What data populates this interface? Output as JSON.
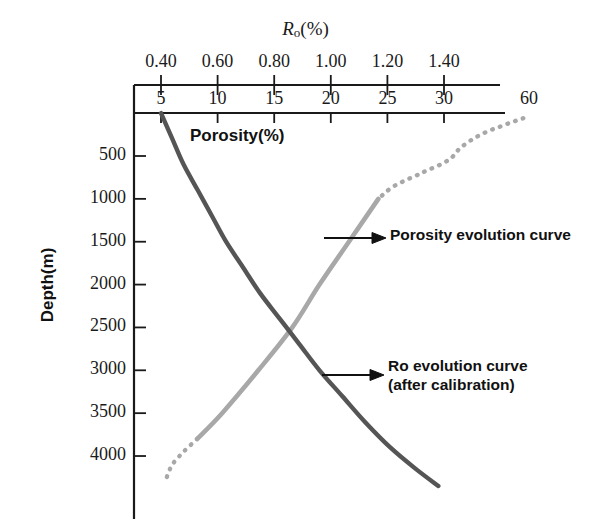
{
  "axes": {
    "ro": {
      "title_main": "R",
      "title_sub": "o",
      "title_unit": "(%)",
      "ticks": [
        "0.40",
        "0.60",
        "0.80",
        "1.00",
        "1.20",
        "1.40"
      ],
      "tick_values": [
        0.4,
        0.6,
        0.8,
        1.0,
        1.2,
        1.4
      ]
    },
    "porosity": {
      "title": "Porosity(%)",
      "ticks": [
        "5",
        "10",
        "15",
        "20",
        "25",
        "30",
        "60"
      ],
      "tick_values": [
        5,
        10,
        15,
        20,
        25,
        30,
        60
      ]
    },
    "depth": {
      "title": "Depth(m)",
      "ticks": [
        "500",
        "1000",
        "1500",
        "2000",
        "2500",
        "3000",
        "3500",
        "4000"
      ],
      "tick_values": [
        500,
        1000,
        1500,
        2000,
        2500,
        3000,
        3500,
        4000
      ]
    }
  },
  "annotations": {
    "porosity_curve": "Porosity evolution curve",
    "ro_curve_line1": "Ro evolution curve",
    "ro_curve_line2": "(after calibration)"
  },
  "colors": {
    "porosity_curve": "#a8a8a8",
    "ro_curve": "#555555",
    "axis": "#1a1a1a",
    "text": "#111111",
    "background": "#ffffff"
  },
  "chart_data": {
    "type": "line",
    "title": "",
    "xlabel": "Porosity(%) / Ro(%)",
    "ylabel": "Depth(m)",
    "ylim": [
      0,
      4400
    ],
    "y_inverted": true,
    "grid": false,
    "legend": "annotations",
    "series": [
      {
        "name": "Porosity evolution curve",
        "x_axis": "porosity",
        "color": "#a8a8a8",
        "style_solid_range_depth": [
          900,
          3900
        ],
        "style_dotted_ranges_depth": [
          [
            0,
            900
          ],
          [
            3900,
            4250
          ]
        ],
        "points": [
          {
            "depth": 4250,
            "porosity": 5.5
          },
          {
            "depth": 4100,
            "porosity": 6.0
          },
          {
            "depth": 3950,
            "porosity": 7.0
          },
          {
            "depth": 3800,
            "porosity": 8.2
          },
          {
            "depth": 3500,
            "porosity": 10.4
          },
          {
            "depth": 3000,
            "porosity": 13.6
          },
          {
            "depth": 2500,
            "porosity": 16.6
          },
          {
            "depth": 2000,
            "porosity": 19.0
          },
          {
            "depth": 1500,
            "porosity": 21.6
          },
          {
            "depth": 1000,
            "porosity": 24.2
          },
          {
            "depth": 850,
            "porosity": 25.6
          },
          {
            "depth": 700,
            "porosity": 28.0
          },
          {
            "depth": 550,
            "porosity": 31.5
          },
          {
            "depth": 400,
            "porosity": 36.0
          },
          {
            "depth": 250,
            "porosity": 43.0
          },
          {
            "depth": 130,
            "porosity": 52.0
          },
          {
            "depth": 60,
            "porosity": 58.0
          }
        ]
      },
      {
        "name": "Ro evolution curve (after calibration)",
        "x_axis": "ro",
        "color": "#555555",
        "style": "solid",
        "points": [
          {
            "depth": 0,
            "ro": 0.4
          },
          {
            "depth": 300,
            "ro": 0.44
          },
          {
            "depth": 600,
            "ro": 0.48
          },
          {
            "depth": 900,
            "ro": 0.53
          },
          {
            "depth": 1200,
            "ro": 0.58
          },
          {
            "depth": 1500,
            "ro": 0.63
          },
          {
            "depth": 1800,
            "ro": 0.69
          },
          {
            "depth": 2100,
            "ro": 0.75
          },
          {
            "depth": 2400,
            "ro": 0.82
          },
          {
            "depth": 2700,
            "ro": 0.89
          },
          {
            "depth": 3000,
            "ro": 0.96
          },
          {
            "depth": 3300,
            "ro": 1.04
          },
          {
            "depth": 3600,
            "ro": 1.12
          },
          {
            "depth": 3900,
            "ro": 1.21
          },
          {
            "depth": 4150,
            "ro": 1.3
          },
          {
            "depth": 4350,
            "ro": 1.38
          }
        ]
      }
    ]
  }
}
